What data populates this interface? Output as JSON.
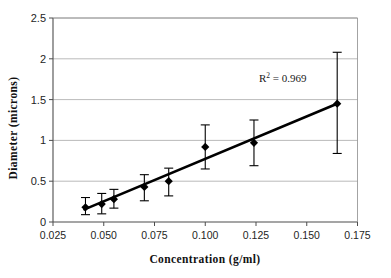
{
  "chart_data": {
    "type": "scatter",
    "title": "",
    "xlabel": "Concentration (g/ml)",
    "ylabel": "Diameter (microns)",
    "xlim": [
      0.025,
      0.175
    ],
    "ylim": [
      0,
      2.5
    ],
    "xticks": [
      0.025,
      0.05,
      0.075,
      0.1,
      0.125,
      0.15,
      0.175
    ],
    "xtick_labels": [
      "0.025",
      "0.050",
      "0.075",
      "0.100",
      "0.125",
      "0.150",
      "0.175"
    ],
    "yticks": [
      0,
      0.5,
      1,
      1.5,
      2,
      2.5
    ],
    "ytick_labels": [
      "0",
      "0.5",
      "1",
      "1.5",
      "2",
      "2.5"
    ],
    "grid": "horizontal",
    "legend": "none",
    "marker": "filled-diamond",
    "marker_color": "#000000",
    "line_color": "#000000",
    "gridline_color": "#a8a8a8",
    "axis_color": "#666666",
    "points": [
      {
        "x": 0.041,
        "y": 0.18,
        "yerr_low": 0.09,
        "yerr_high": 0.3
      },
      {
        "x": 0.049,
        "y": 0.22,
        "yerr_low": 0.1,
        "yerr_high": 0.35
      },
      {
        "x": 0.055,
        "y": 0.28,
        "yerr_low": 0.17,
        "yerr_high": 0.4
      },
      {
        "x": 0.07,
        "y": 0.43,
        "yerr_low": 0.26,
        "yerr_high": 0.58
      },
      {
        "x": 0.082,
        "y": 0.5,
        "yerr_low": 0.32,
        "yerr_high": 0.66
      },
      {
        "x": 0.1,
        "y": 0.92,
        "yerr_low": 0.65,
        "yerr_high": 1.19
      },
      {
        "x": 0.124,
        "y": 0.97,
        "yerr_low": 0.69,
        "yerr_high": 1.25
      },
      {
        "x": 0.165,
        "y": 1.45,
        "yerr_low": 0.84,
        "yerr_high": 2.08
      }
    ],
    "trendline": {
      "x0": 0.0405,
      "y0": 0.155,
      "x1": 0.1655,
      "y1": 1.455
    },
    "annotations": [
      {
        "name": "r-squared",
        "prefix": "R",
        "superscript": "2",
        "suffix": " = 0.969",
        "x": 0.1265,
        "y": 1.76
      }
    ]
  },
  "annotation_text": {
    "r_prefix": "R",
    "r_superscript": "2",
    "r_value": " = 0.969"
  }
}
